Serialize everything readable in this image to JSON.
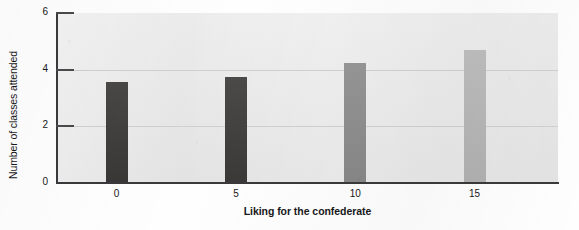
{
  "chart_data": {
    "type": "bar",
    "title": "",
    "xlabel": "Liking for the confederate",
    "ylabel": "Number of classes attended",
    "categories": [
      "0",
      "5",
      "10",
      "15"
    ],
    "values": [
      3.55,
      3.75,
      4.25,
      4.7
    ],
    "bar_colors": [
      "#3b3a38",
      "#3d3c3a",
      "#8e8e8e",
      "#b9b9b9"
    ],
    "xlim": [
      -2.5,
      18.5
    ],
    "ylim": [
      0,
      6
    ],
    "yticks": [
      "0",
      "2",
      "4",
      "6"
    ],
    "ytick_values": [
      0,
      2,
      4,
      6
    ],
    "xticks": [
      "0",
      "5",
      "10",
      "15"
    ],
    "xtick_values": [
      0,
      5,
      10,
      15
    ],
    "grid": "horizontal",
    "legend": "none",
    "plot_background": "#e7e7e7",
    "axis_color": "#3a3a3c",
    "gridline_color": "#cfcfcf",
    "text_color": "#18181a"
  },
  "axes": {
    "y_title": "Number of classes attended",
    "x_title": "Liking for the confederate"
  },
  "ticks": {
    "y": [
      {
        "label": "6",
        "value": 6
      },
      {
        "label": "4",
        "value": 4
      },
      {
        "label": "2",
        "value": 2
      },
      {
        "label": "0",
        "value": 0
      }
    ],
    "x": [
      {
        "label": "0",
        "value": 0
      },
      {
        "label": "5",
        "value": 5
      },
      {
        "label": "10",
        "value": 10
      },
      {
        "label": "15",
        "value": 15
      }
    ]
  },
  "bars": [
    {
      "category": "0",
      "value": 3.55,
      "color": "#3b3a38"
    },
    {
      "category": "5",
      "value": 3.75,
      "color": "#3d3c3a"
    },
    {
      "category": "10",
      "value": 4.25,
      "color": "#8e8e8e"
    },
    {
      "category": "15",
      "value": 4.7,
      "color": "#b9b9b9"
    }
  ]
}
